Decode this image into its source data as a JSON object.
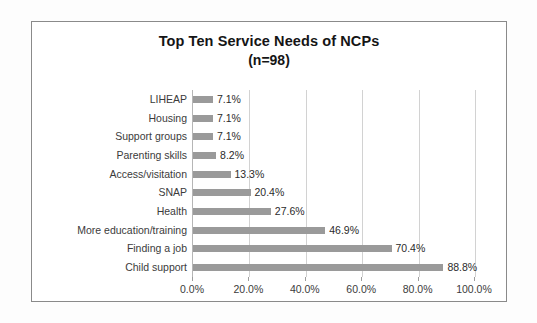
{
  "chart_data": {
    "type": "bar",
    "orientation": "horizontal",
    "title": "Top Ten Service Needs of NCPs",
    "subtitle": "(n=98)",
    "xlabel": "",
    "ylabel": "",
    "xlim": [
      0,
      100
    ],
    "grid": true,
    "legend": false,
    "categories": [
      "LIHEAP",
      "Housing",
      "Support groups",
      "Parenting skills",
      "Access/visitation",
      "SNAP",
      "Health",
      "More education/training",
      "Finding a job",
      "Child support"
    ],
    "values": [
      7.1,
      7.1,
      7.1,
      8.2,
      13.3,
      20.4,
      27.6,
      46.9,
      70.4,
      88.8
    ],
    "data_labels": [
      "7.1%",
      "7.1%",
      "7.1%",
      "8.2%",
      "13.3%",
      "20.4%",
      "27.6%",
      "46.9%",
      "70.4%",
      "88.8%"
    ],
    "xticks": [
      0,
      20,
      40,
      60,
      80,
      100
    ],
    "xtick_labels": [
      "0.0%",
      "20.0%",
      "40.0%",
      "60.0%",
      "80.0%",
      "100.0%"
    ],
    "bar_color": "#9a9a9a",
    "gridline_color": "#d2d2d2",
    "axis_color": "#b6b6b6",
    "plot_background": "#ffffff",
    "border_color": "#8a8a8a"
  }
}
